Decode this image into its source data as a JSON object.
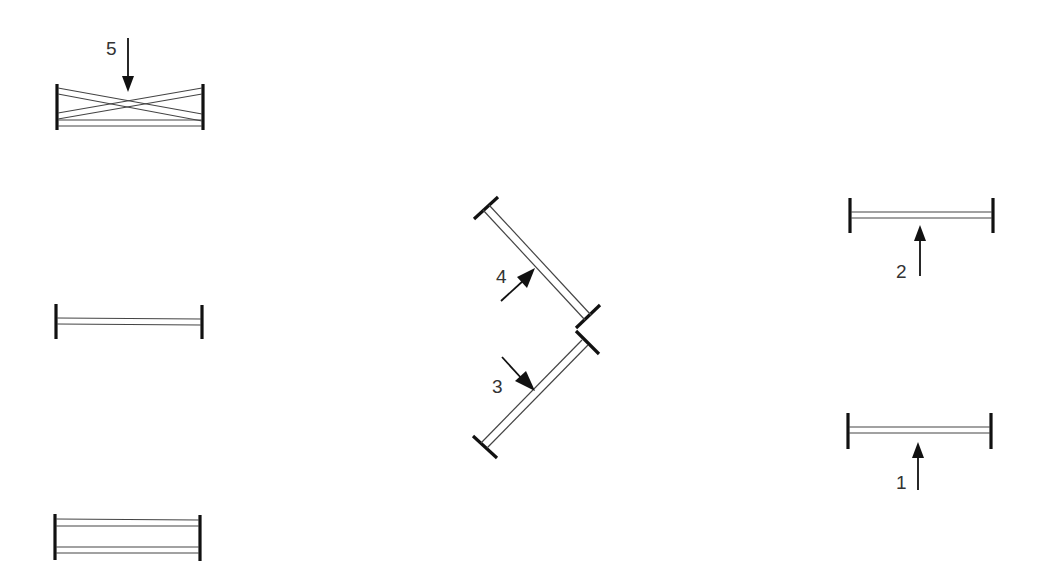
{
  "diagram": {
    "type": "obstacle-course-plan",
    "colors": {
      "post": "#111111",
      "rail": "#444444",
      "arrow": "#111111",
      "label": "#333333",
      "background": "#ffffff"
    },
    "obstacles": [
      {
        "id": "cross-rail",
        "number": "5",
        "kind": "crossed-rails-vertical",
        "approach": "down"
      },
      {
        "id": "single-left",
        "number": "",
        "kind": "vertical"
      },
      {
        "id": "oxer-left",
        "number": "",
        "kind": "oxer"
      },
      {
        "id": "diag-4",
        "number": "4",
        "kind": "vertical-diagonal",
        "approach": "up-right"
      },
      {
        "id": "diag-3",
        "number": "3",
        "kind": "vertical-diagonal",
        "approach": "down-right"
      },
      {
        "id": "right-top",
        "number": "2",
        "kind": "vertical",
        "approach": "up"
      },
      {
        "id": "right-bottom",
        "number": "1",
        "kind": "vertical",
        "approach": "up"
      }
    ],
    "labels": {
      "l1": "1",
      "l2": "2",
      "l3": "3",
      "l4": "4",
      "l5": "5"
    }
  }
}
